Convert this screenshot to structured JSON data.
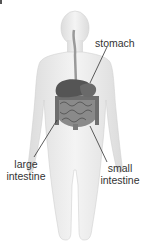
{
  "diagram": {
    "labels": {
      "stomach": "stomach",
      "large_intestine_line1": "large",
      "large_intestine_line2": "intestine",
      "small_intestine_line1": "small",
      "small_intestine_line2": "intestine"
    },
    "colors": {
      "body_fill": "#e9e9e9",
      "body_outline": "#c8c8c8",
      "organ_dark": "#555555",
      "organ_mid": "#8a8a8a",
      "leader_line": "#333333",
      "label_text": "#333333"
    }
  }
}
